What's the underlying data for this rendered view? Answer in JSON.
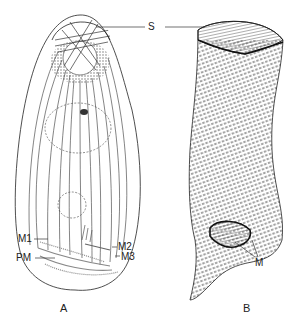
{
  "figure": {
    "panels": [
      {
        "id": "A",
        "label": "A",
        "description": "Ciliate, ventral view: somatic kineties, oral region"
      },
      {
        "id": "B",
        "label": "B",
        "description": "Ciliate, lateral view with spiral kineties"
      }
    ],
    "labels": {
      "S": "S",
      "M1": "M1",
      "M2": "M2",
      "M3": "M3",
      "PM": "PM",
      "M": "M"
    },
    "colors": {
      "ink": "#222222",
      "stipple": "#555555",
      "background": "#ffffff"
    }
  }
}
